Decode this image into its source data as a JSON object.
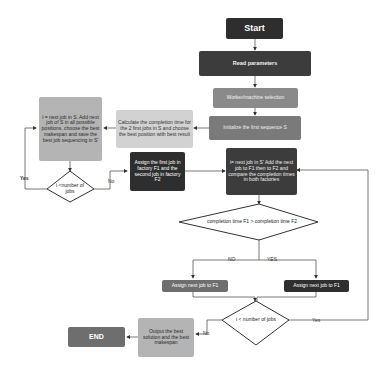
{
  "diagram": {
    "type": "flowchart",
    "nodes": {
      "start": "Start",
      "read_params": "Read parameters",
      "worker_selection": "Worker/machine selection",
      "initialize": "Initialize the first sequence S",
      "calc_completion": "Calculate the completion time for the 2 first jobs in S and choose the best position with best result",
      "insert_job": "i = next job in S. Add next job of S in all possible positions, choose the best makespan and save the best job sequencing in S'",
      "decision_left": "i <number of jobs",
      "assign_first": "Assign the first job in factory F1 and the second job in factory F2",
      "next_job_compare": "i= next job in S' Add the next job to F1 then to F2 and compare the completion times in both factories",
      "decision_compare": "completion time F1 > completion time F2",
      "assign_f1_no": "Assign next job to F1",
      "assign_f1_yes": "Assign next job to F1",
      "decision_bottom": "i < number of jobs",
      "output": "Output the best solution and the best makespan",
      "end": "END"
    },
    "edge_labels": {
      "left_yes": "Yes",
      "left_no": "No",
      "compare_no": "NO",
      "compare_yes": "YES",
      "bottom_yes": "Yes",
      "bottom_no": "No"
    }
  }
}
